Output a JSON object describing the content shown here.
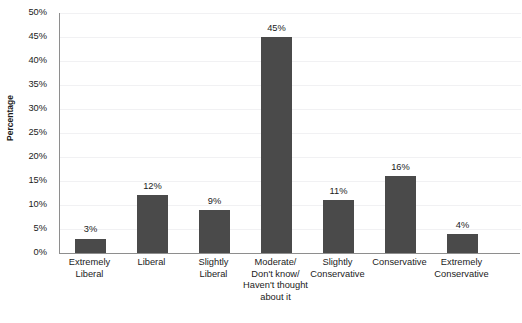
{
  "chart_data": {
    "type": "bar",
    "title": "",
    "xlabel": "",
    "ylabel": "Percentage",
    "ylim": [
      0,
      50
    ],
    "ytick_step": 5,
    "grid": true,
    "legend": false,
    "bar_color": "#4a4a4a",
    "categories": [
      "Extremely\nLiberal",
      "Liberal",
      "Slightly\nLiberal",
      "Moderate/\nDon't know/\nHaven't thought\nabout it",
      "Slightly\nConservative",
      "Conservative",
      "Extremely\nConservative"
    ],
    "values": [
      3,
      12,
      9,
      45,
      11,
      16,
      4
    ],
    "data_labels": [
      "3%",
      "12%",
      "9%",
      "45%",
      "11%",
      "16%",
      "4%"
    ],
    "ytick_labels": [
      "0%",
      "5%",
      "10%",
      "15%",
      "20%",
      "25%",
      "30%",
      "35%",
      "40%",
      "45%",
      "50%"
    ],
    "ytick_values": [
      0,
      5,
      10,
      15,
      20,
      25,
      30,
      35,
      40,
      45,
      50
    ]
  },
  "axes": {
    "y_title": "Percentage"
  },
  "header": {
    "cropped_title": ""
  }
}
